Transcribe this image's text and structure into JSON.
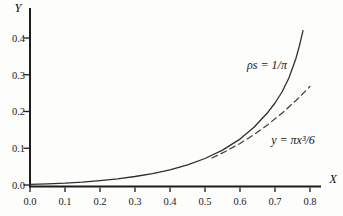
{
  "figure": {
    "background": "#fdfdfc",
    "axis_color": "#1c1c1c",
    "text_color": "#1a1a1a"
  },
  "chart_data": {
    "type": "line",
    "title": "",
    "xlabel": "X",
    "ylabel": "Y",
    "xlim": [
      0,
      0.8
    ],
    "ylim": [
      0,
      0.45
    ],
    "grid": false,
    "legend_position": "none",
    "x_ticks": [
      0.0,
      0.1,
      0.2,
      0.3,
      0.4,
      0.5,
      0.6,
      0.7,
      0.8
    ],
    "x_tick_labels": [
      "0.0",
      "0.1",
      "0.2",
      "0.3",
      "0.4",
      "0.5",
      "0.6",
      "0.7",
      "0.8"
    ],
    "y_ticks": [
      0.0,
      0.1,
      0.2,
      0.3,
      0.4
    ],
    "y_tick_labels": [
      "0.0",
      "0.1",
      "0.2",
      "0.3",
      "0.4"
    ],
    "series": [
      {
        "name": "exact-curve",
        "label": "ρs = 1/π",
        "style": "solid",
        "color": "#2e2e2e",
        "x": [
          0.0,
          0.05,
          0.1,
          0.15,
          0.2,
          0.25,
          0.3,
          0.35,
          0.4,
          0.45,
          0.5,
          0.55,
          0.6,
          0.64,
          0.68,
          0.7,
          0.72,
          0.74,
          0.76,
          0.77,
          0.78
        ],
        "y": [
          0.002,
          0.003,
          0.005,
          0.008,
          0.012,
          0.017,
          0.023,
          0.031,
          0.041,
          0.055,
          0.072,
          0.095,
          0.125,
          0.157,
          0.198,
          0.223,
          0.253,
          0.292,
          0.345,
          0.38,
          0.42
        ]
      },
      {
        "name": "cubic-approximation",
        "label": "y = πx³/6",
        "style": "dashed",
        "color": "#3c3c3c",
        "x": [
          0.52,
          0.56,
          0.6,
          0.64,
          0.68,
          0.72,
          0.76,
          0.8
        ],
        "y": [
          0.0736,
          0.092,
          0.1131,
          0.1372,
          0.1646,
          0.1954,
          0.2298,
          0.2681
        ]
      }
    ],
    "annotations": [
      {
        "text": "ρs = 1/π",
        "x": 0.68,
        "y": 0.33
      },
      {
        "text": "y = πx³/6",
        "x": 0.75,
        "y": 0.115
      }
    ]
  }
}
